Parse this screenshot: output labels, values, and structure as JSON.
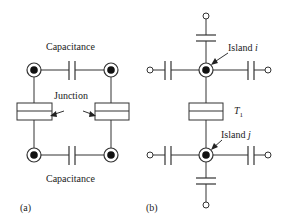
{
  "panel_a": {
    "label": "(a)",
    "top_capacitor_label": "Capacitance",
    "bottom_capacitor_label": "Capacitance",
    "junction_label": "Junction",
    "nodes": [
      {
        "id": "top-left",
        "x": 34,
        "y": 70
      },
      {
        "id": "top-right",
        "x": 111,
        "y": 70
      },
      {
        "id": "bottom-left",
        "x": 34,
        "y": 155
      },
      {
        "id": "bottom-right",
        "x": 111,
        "y": 155
      }
    ]
  },
  "panel_b": {
    "label": "(b)",
    "island_i_label": "Island ",
    "island_i_var": "i",
    "island_j_label": "Island ",
    "island_j_var": "j",
    "junction_label": "T",
    "junction_subscript": "1"
  },
  "colors": {
    "line": "#333333",
    "node_fill": "#111111",
    "background": "#ffffff"
  }
}
